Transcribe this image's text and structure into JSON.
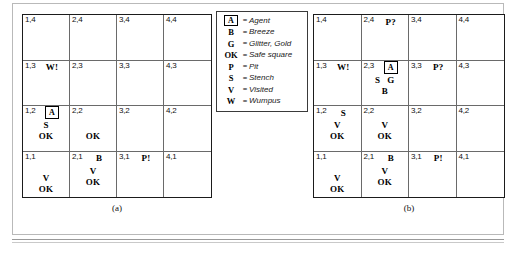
{
  "figure": {
    "caption_a": "(a)",
    "caption_b": "(b)"
  },
  "legend": {
    "rows": [
      {
        "key": "A",
        "key_boxed": true,
        "eq": "=",
        "desc": "Agent"
      },
      {
        "key": "B",
        "key_boxed": false,
        "eq": "=",
        "desc": "Breeze"
      },
      {
        "key": "G",
        "key_boxed": false,
        "eq": "=",
        "desc": "Glitter, Gold"
      },
      {
        "key": "OK",
        "key_boxed": false,
        "eq": "=",
        "desc": "Safe square"
      },
      {
        "key": "P",
        "key_boxed": false,
        "eq": "=",
        "desc": "Pit"
      },
      {
        "key": "S",
        "key_boxed": false,
        "eq": "=",
        "desc": "Stench"
      },
      {
        "key": "V",
        "key_boxed": false,
        "eq": "=",
        "desc": "Visited"
      },
      {
        "key": "W",
        "key_boxed": false,
        "eq": "=",
        "desc": "Wumpus"
      }
    ]
  },
  "grid_a": {
    "cells": [
      {
        "coord": "1,4",
        "inline": [],
        "marks": []
      },
      {
        "coord": "2,4",
        "inline": [],
        "marks": []
      },
      {
        "coord": "3,4",
        "inline": [],
        "marks": []
      },
      {
        "coord": "4,4",
        "inline": [],
        "marks": []
      },
      {
        "coord": "1,3",
        "inline": [
          "W!"
        ],
        "marks": []
      },
      {
        "coord": "2,3",
        "inline": [],
        "marks": []
      },
      {
        "coord": "3,3",
        "inline": [],
        "marks": []
      },
      {
        "coord": "4,3",
        "inline": [],
        "marks": []
      },
      {
        "coord": "1,2",
        "inline": [
          "A"
        ],
        "agent_inline": true,
        "marks": [
          "S",
          "OK"
        ]
      },
      {
        "coord": "2,2",
        "inline": [],
        "marks": [
          "",
          "OK"
        ]
      },
      {
        "coord": "3,2",
        "inline": [],
        "marks": []
      },
      {
        "coord": "4,2",
        "inline": [],
        "marks": []
      },
      {
        "coord": "1,1",
        "inline": [],
        "marks": [
          "",
          "V",
          "OK"
        ]
      },
      {
        "coord": "2,1",
        "inline": [
          "B"
        ],
        "marks": [
          "V",
          "OK"
        ]
      },
      {
        "coord": "3,1",
        "inline": [
          "P!"
        ],
        "marks": []
      },
      {
        "coord": "4,1",
        "inline": [],
        "marks": []
      }
    ]
  },
  "grid_b": {
    "cells": [
      {
        "coord": "1,4",
        "inline": [],
        "marks": []
      },
      {
        "coord": "2,4",
        "inline": [
          "P?"
        ],
        "marks": []
      },
      {
        "coord": "3,4",
        "inline": [],
        "marks": []
      },
      {
        "coord": "4,4",
        "inline": [],
        "marks": []
      },
      {
        "coord": "1,3",
        "inline": [
          "W!"
        ],
        "marks": []
      },
      {
        "coord": "2,3",
        "inline": [
          "A"
        ],
        "agent_inline": true,
        "marks": [
          "S G",
          "B"
        ]
      },
      {
        "coord": "3,3",
        "inline": [
          "P?"
        ],
        "marks": []
      },
      {
        "coord": "4,3",
        "inline": [],
        "marks": []
      },
      {
        "coord": "1,2",
        "inline": [
          "S"
        ],
        "marks": [
          "V",
          "OK"
        ]
      },
      {
        "coord": "2,2",
        "inline": [],
        "marks": [
          "V",
          "OK"
        ]
      },
      {
        "coord": "3,2",
        "inline": [],
        "marks": []
      },
      {
        "coord": "4,2",
        "inline": [],
        "marks": []
      },
      {
        "coord": "1,1",
        "inline": [],
        "marks": [
          "",
          "V",
          "OK"
        ]
      },
      {
        "coord": "2,1",
        "inline": [
          "B"
        ],
        "marks": [
          "V",
          "OK"
        ]
      },
      {
        "coord": "3,1",
        "inline": [
          "P!"
        ],
        "marks": []
      },
      {
        "coord": "4,1",
        "inline": [],
        "marks": []
      }
    ]
  }
}
